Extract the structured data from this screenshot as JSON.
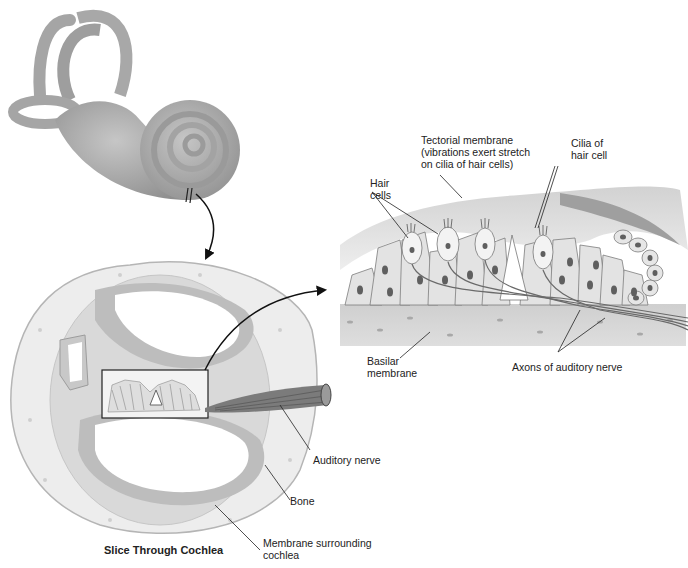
{
  "diagram": {
    "title": "Slice Through Cochlea",
    "labels": {
      "tectorial": "Tectorial membrane\n(vibrations exert stretch\non cilia of hair cells)",
      "cilia": "Cilia of\nhair cell",
      "hair_cells": "Hair\ncells",
      "basilar": "Basilar\nmembrane",
      "axons": "Axons of auditory nerve",
      "auditory_nerve": "Auditory nerve",
      "bone": "Bone",
      "membrane_surrounding": "Membrane surrounding\ncochlea"
    },
    "colors": {
      "bone": "#ececec",
      "membrane": "#bdbdbd",
      "cell": "#e4e4e4",
      "nucleus": "#6a6a6a",
      "nerve": "#6e6e6e",
      "inner_ear": "#a8a8a8"
    }
  }
}
